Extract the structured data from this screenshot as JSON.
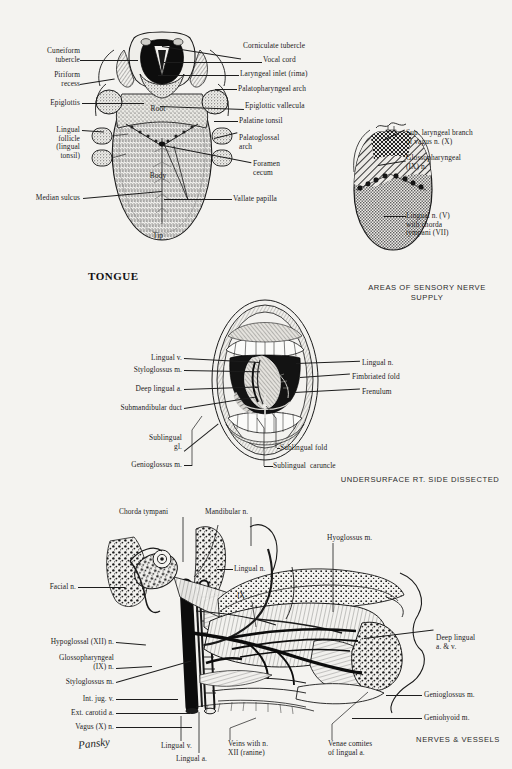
{
  "page": {
    "background_color": "#f4f3f0",
    "ink_color": "#1a1a1a",
    "artist_signature": "Pansky"
  },
  "figures": [
    {
      "id": "dorsum-of-tongue",
      "title": "TONGUE",
      "intrinsic_labels": [
        "Root",
        "Body",
        "Tip"
      ],
      "labels_left": [
        "Cuneiform\ntubercle",
        "Piriform\nrecess",
        "Epiglottis",
        "Lingual\nfollicle\n(lingual\ntonsil)",
        "Median sulcus"
      ],
      "labels_right": [
        "Corniculate tubercle",
        "Vocal cord",
        "Laryngeal inlet (rima)",
        "Palatopharyngeal arch",
        "Epiglottic vallecula",
        "Palatine tonsil",
        "Palatoglossal\narch",
        "Foramen\ncecum",
        "Vallate papilla"
      ]
    },
    {
      "id": "areas-of-sensory-nerve-supply",
      "caption": "AREAS OF SENSORY\nNERVE SUPPLY",
      "labels_right": [
        "Sup. laryngeal branch\nof vagus n. (X)",
        "Glossopharyngeal\n(IX) n.",
        "Lingual n. (V)\nwith chorda\ntympani (VII)"
      ],
      "regions": [
        {
          "name": "vagus-region",
          "pattern": "dense-crosshatch"
        },
        {
          "name": "glossopharyngeal-region",
          "pattern": "diagonal-hatch"
        },
        {
          "name": "lingual-region",
          "pattern": "fine-checker"
        }
      ]
    },
    {
      "id": "undersurface-of-tongue",
      "caption": "UNDERSURFACE\nRT. SIDE DISSECTED",
      "labels_left": [
        "Lingual v.",
        "Styloglossus m.",
        "Deep lingual a.",
        "Submandibular duct",
        "Sublingual\ngl.",
        "Genioglossus m."
      ],
      "labels_right": [
        "Lingual n.",
        "Fimbriated fold",
        "Frenulum",
        "Sublingual fold",
        "Sublingual  caruncle"
      ]
    },
    {
      "id": "nerves-and-vessels",
      "caption": "NERVES &\nVESSELS",
      "labels_top": [
        "Chorda tympani",
        "Mandibular n.",
        "Hyoglossus m."
      ],
      "labels_left": [
        "Facial n.",
        "Hypoglossal (XII) n.",
        "Glossopharyngeal\n(IX) n.",
        "Styloglossus m.",
        "Int. jug. v.",
        "Ext. carotid a.",
        "Vagus (X) n."
      ],
      "labels_right": [
        "Lingual n.",
        "Deep lingual\na. & v.",
        "Genioglossus m.",
        "Geniohyoid m."
      ],
      "labels_bottom": [
        "Lingual v.",
        "Lingual a.",
        "Veins with n.\nXII (ranine)",
        "Venae comites\nof lingual a."
      ],
      "labels_inline": [
        "IX"
      ]
    }
  ]
}
